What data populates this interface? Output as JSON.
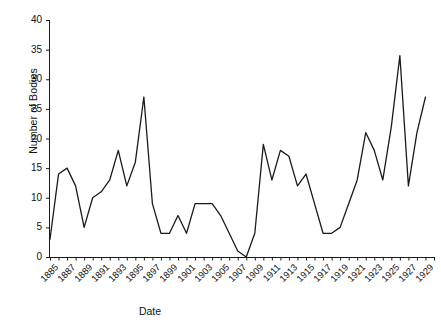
{
  "chart_data": {
    "type": "line",
    "title": "",
    "xlabel": "Date",
    "ylabel": "Number of Bodies",
    "xlim": [
      1885,
      1930
    ],
    "ylim": [
      0,
      40
    ],
    "yticks": [
      0,
      5,
      10,
      15,
      20,
      25,
      30,
      35,
      40
    ],
    "xticks": [
      1885,
      1887,
      1889,
      1891,
      1893,
      1895,
      1897,
      1899,
      1901,
      1903,
      1905,
      1907,
      1909,
      1911,
      1913,
      1915,
      1917,
      1919,
      1921,
      1923,
      1925,
      1927,
      1929
    ],
    "xtick_labels": [
      "1885",
      "1887",
      "1889",
      "1891",
      "1893",
      "1895",
      "1897",
      "1899",
      "1901",
      "1903",
      "1905",
      "1907",
      "1909",
      "1911",
      "1913",
      "1915",
      "1917",
      "1919",
      "1921",
      "1923",
      "1925",
      "1927",
      "1929"
    ],
    "grid": false,
    "legend": null,
    "series": [
      {
        "name": "Number of Bodies",
        "color": "#1a1a1a",
        "x": [
          1885,
          1886,
          1887,
          1888,
          1889,
          1890,
          1891,
          1892,
          1893,
          1894,
          1895,
          1896,
          1897,
          1898,
          1899,
          1900,
          1901,
          1902,
          1903,
          1904,
          1905,
          1906,
          1907,
          1908,
          1909,
          1910,
          1911,
          1912,
          1913,
          1914,
          1915,
          1916,
          1917,
          1918,
          1919,
          1920,
          1921,
          1922,
          1923,
          1924,
          1925,
          1926,
          1927,
          1928,
          1929
        ],
        "values": [
          3,
          14,
          15,
          12,
          5,
          10,
          11,
          13,
          18,
          12,
          16,
          27,
          9,
          4,
          4,
          7,
          4,
          9,
          9,
          9,
          7,
          4,
          1,
          0,
          4,
          19,
          13,
          18,
          17,
          12,
          14,
          9,
          4,
          4,
          5,
          9,
          13,
          21,
          18,
          13,
          22,
          34,
          12,
          21,
          27
        ]
      }
    ]
  },
  "axis": {
    "y_title": "Number of Bodies",
    "x_title": "Date"
  }
}
